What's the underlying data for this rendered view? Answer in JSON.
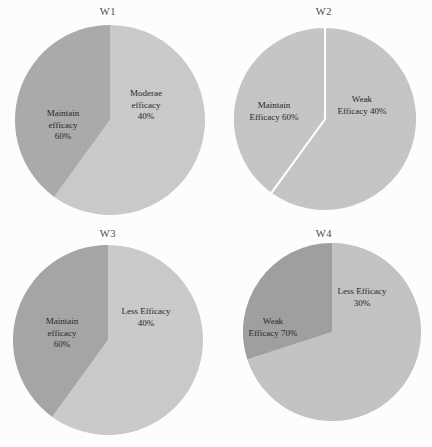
{
  "figure": {
    "background_color": "#ffffff",
    "panel_count": 4,
    "layout": "2x2 grid of pie charts"
  },
  "chart_data": [
    {
      "type": "pie",
      "title": "W1",
      "categories": [
        "Maintain efficacy",
        "Moderae efficacy"
      ],
      "values": [
        60,
        40
      ],
      "labels": [
        "Maintain\nefficacy\n60%",
        "Moderae\nefficacy\n40%"
      ],
      "colors": [
        "#cbcbcb",
        "#ababab"
      ],
      "start_angle": 0,
      "direction": "clockwise",
      "separator": "none",
      "xlabel": "",
      "ylabel": "",
      "legend": "none"
    },
    {
      "type": "pie",
      "title": "W2",
      "categories": [
        "Maintain Efficacy",
        "Weak Efficacy"
      ],
      "values": [
        60,
        40
      ],
      "labels": [
        "Maintain\nEfficacy 60%",
        "Weak\nEfficacy 40%"
      ],
      "colors": [
        "#c6c6c6",
        "#c6c6c6"
      ],
      "start_angle": 0,
      "direction": "clockwise",
      "separator": "white",
      "xlabel": "",
      "ylabel": "",
      "legend": "none"
    },
    {
      "type": "pie",
      "title": "W3",
      "categories": [
        "Maintain efficacy",
        "Less Efficacy"
      ],
      "values": [
        60,
        40
      ],
      "labels": [
        "Maintain\nefficacy\n60%",
        "Less Efficacy\n40%"
      ],
      "colors": [
        "#cbcbcb",
        "#a6a6a6"
      ],
      "start_angle": 0,
      "direction": "clockwise",
      "separator": "none",
      "xlabel": "",
      "ylabel": "",
      "legend": "none"
    },
    {
      "type": "pie",
      "title": "W4",
      "categories": [
        "Weak Efficacy",
        "Less Efficacy"
      ],
      "values": [
        70,
        30
      ],
      "labels": [
        "Weak\nEfficacy 70%",
        "Less Efficacy\n30%"
      ],
      "colors": [
        "#c4c4c4",
        "#a0a0a0"
      ],
      "start_angle": 0,
      "direction": "clockwise",
      "separator": "none",
      "xlabel": "",
      "ylabel": "",
      "legend": "none"
    }
  ]
}
